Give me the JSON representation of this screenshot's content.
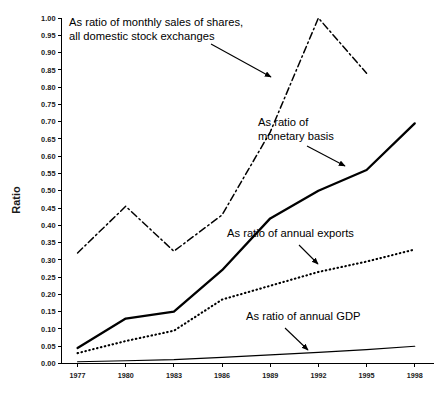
{
  "chart_data": {
    "type": "line",
    "title": "",
    "xlabel": "",
    "ylabel": "Ratio",
    "grid": false,
    "legend_position": "inline-annotations",
    "x": [
      1977,
      1980,
      1983,
      1986,
      1989,
      1992,
      1995,
      1998
    ],
    "xtick_labels": [
      "1977",
      "1980",
      "1983",
      "1986",
      "1989",
      "1992",
      "1995",
      "1998"
    ],
    "xlim": [
      1976,
      1999.2
    ],
    "ylim": [
      0.0,
      1.0
    ],
    "ytick_labels": [
      "0.00",
      "0.05",
      "0.10",
      "0.15",
      "0.20",
      "0.25",
      "0.30",
      "0.35",
      "0.40",
      "0.45",
      "0.50",
      "0.55",
      "0.60",
      "0.65",
      "0.70",
      "0.75",
      "0.80",
      "0.85",
      "0.90",
      "0.95",
      "1.00"
    ],
    "ytick_values": [
      0.0,
      0.05,
      0.1,
      0.15,
      0.2,
      0.25,
      0.3,
      0.35,
      0.4,
      0.45,
      0.5,
      0.55,
      0.6,
      0.65,
      0.7,
      0.75,
      0.8,
      0.85,
      0.9,
      0.95,
      1.0
    ],
    "series": [
      {
        "name": "As ratio of monthly sales of shares, all domestic stock exchanges",
        "style": "dash-dot",
        "x": [
          1977,
          1980,
          1983,
          1986,
          1989,
          1992,
          1995
        ],
        "values": [
          0.32,
          0.455,
          0.325,
          0.43,
          0.67,
          1.0,
          0.84
        ]
      },
      {
        "name": "As ratio of monetary basis",
        "style": "solid-thick",
        "x": [
          1977,
          1980,
          1983,
          1986,
          1989,
          1992,
          1995,
          1998
        ],
        "values": [
          0.045,
          0.13,
          0.15,
          0.27,
          0.42,
          0.5,
          0.56,
          0.695
        ]
      },
      {
        "name": "As ratio of annual exports",
        "style": "dotted",
        "x": [
          1977,
          1980,
          1983,
          1986,
          1989,
          1992,
          1995,
          1998
        ],
        "values": [
          0.03,
          0.065,
          0.095,
          0.185,
          0.225,
          0.265,
          0.295,
          0.33
        ]
      },
      {
        "name": "As ratio of annual GDP",
        "style": "solid-thin",
        "x": [
          1977,
          1980,
          1983,
          1986,
          1989,
          1992,
          1995,
          1998
        ],
        "values": [
          0.005,
          0.008,
          0.011,
          0.018,
          0.025,
          0.032,
          0.04,
          0.05
        ]
      }
    ],
    "annotations": [
      {
        "id": "monthly-sales",
        "lines": [
          "As ratio of monthly sales of shares,",
          "all domestic stock exchanges"
        ]
      },
      {
        "id": "monetary-basis",
        "lines": [
          "As ratio of",
          "monetary basis"
        ]
      },
      {
        "id": "annual-exports",
        "lines": [
          "As ratio of annual exports"
        ]
      },
      {
        "id": "annual-gdp",
        "lines": [
          "As ratio of annual GDP"
        ]
      }
    ],
    "colors": {
      "ink": "#000000",
      "background": "#ffffff"
    }
  }
}
